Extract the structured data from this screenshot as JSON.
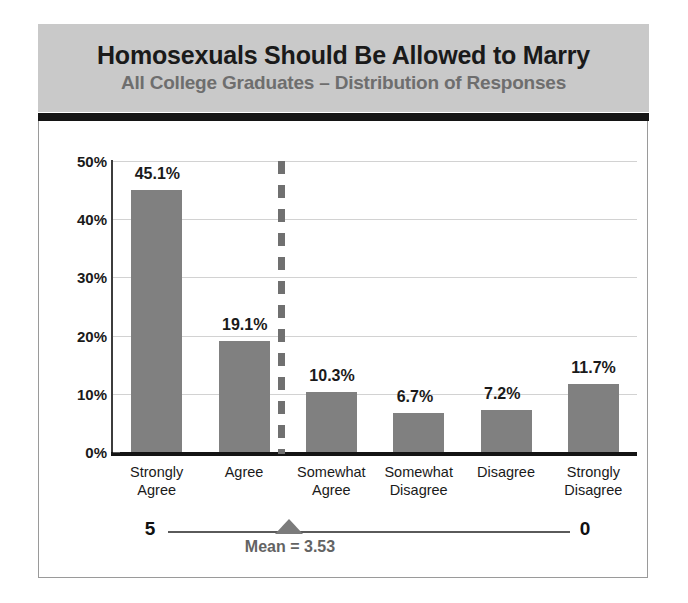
{
  "header": {
    "title": "Homosexuals Should Be Allowed to Marry",
    "subtitle": "All College Graduates – Distribution of Responses"
  },
  "scale": {
    "left_label": "5",
    "right_label": "0",
    "mean_label": "Mean = 3.53",
    "mean_value": 3.53
  },
  "colors": {
    "bar_fill": "#808080",
    "header_band": "#c9c9c9",
    "header_rule": "#141414",
    "title_text": "#1a1a1a",
    "subtitle_text": "#6e6e6e",
    "gridline": "#d2d2d2",
    "mean_line": "#707070",
    "mean_marker": "#7b7b7b",
    "mean_text": "#636363"
  },
  "chart_data": {
    "type": "bar",
    "title": "Homosexuals Should Be Allowed to Marry",
    "subtitle": "All College Graduates – Distribution of Responses",
    "xlabel": "",
    "ylabel": "",
    "ylim": [
      0,
      50
    ],
    "ytick_labels": [
      "0%",
      "10%",
      "20%",
      "30%",
      "40%",
      "50%"
    ],
    "ytick_values": [
      0,
      10,
      20,
      30,
      40,
      50
    ],
    "grid": true,
    "legend": "none",
    "categories": [
      "Strongly\nAgree",
      "Agree",
      "Somewhat\nAgree",
      "Somewhat\nDisagree",
      "Disagree",
      "Strongly\nDisagree"
    ],
    "values": [
      45.1,
      19.1,
      10.3,
      6.7,
      7.2,
      11.7
    ],
    "data_labels": [
      "45.1%",
      "19.1%",
      "10.3%",
      "6.7%",
      "7.2%",
      "11.7%"
    ],
    "annotations": [
      {
        "name": "mean-line",
        "label": "Mean = 3.53",
        "value": 3.53,
        "style": "vertical-dashed"
      }
    ]
  }
}
